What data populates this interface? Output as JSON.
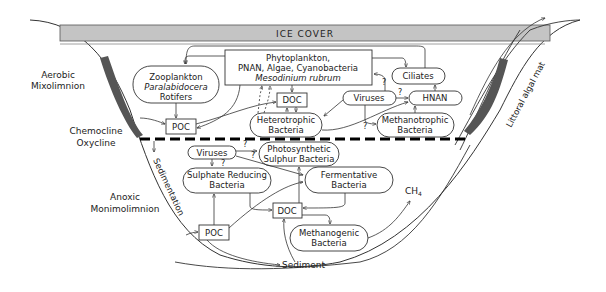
{
  "ice_cover": {
    "label": "ICE COVER",
    "color": "#c4c4c4"
  },
  "zones": {
    "aerobic_line1": "Aerobic",
    "aerobic_line2": "Mixolimnion",
    "chemocline_line1": "Chemocline",
    "chemocline_line2": "Oxycline",
    "anoxic_line1": "Anoxic",
    "anoxic_line2": "Monimolimnion"
  },
  "side_labels": {
    "sedimentation": "Sedimentation",
    "littoral_algal_mat": "Littoral algal mat",
    "sediment": "Sediment",
    "ch4": "CH",
    "ch4_sub": "4"
  },
  "nodes": {
    "phytoplankton": {
      "line1": "Phytoplankton,",
      "line2": "PNAN, Algae, Cyanobacteria",
      "line3": "Mesodinium rubrum"
    },
    "zooplankton": {
      "line1": "Zooplankton",
      "line2": "Paralabidocera",
      "line3": "Rotifers"
    },
    "ciliates": {
      "label": "Ciliates"
    },
    "viruses_upper": {
      "label": "Viruses"
    },
    "hnan": {
      "label": "HNAN"
    },
    "doc_upper": {
      "label": "DOC"
    },
    "heterotrophic": {
      "line1": "Heterotrophic",
      "line2": "Bacteria"
    },
    "methanotrophic": {
      "line1": "Methanotrophic",
      "line2": "Bacteria"
    },
    "poc_upper": {
      "label": "POC"
    },
    "viruses_lower": {
      "label": "Viruses"
    },
    "photosynthetic": {
      "line1": "Photosynthetic",
      "line2": "Sulphur Bacteria"
    },
    "sulphate_reducing": {
      "line1": "Sulphate Reducing",
      "line2": "Bacteria"
    },
    "fermentative": {
      "line1": "Fermentative",
      "line2": "Bacteria"
    },
    "doc_lower": {
      "label": "DOC"
    },
    "methanogenic": {
      "line1": "Methanogenic",
      "line2": "Bacteria"
    },
    "poc_lower": {
      "label": "POC"
    }
  },
  "uncertain_mark": "?",
  "colors": {
    "algal_mat": "#555555",
    "line": "#333333",
    "chemocline": "#000000"
  }
}
